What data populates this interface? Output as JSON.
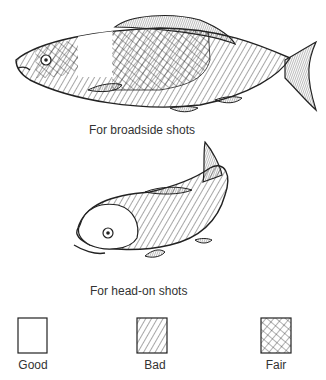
{
  "captions": {
    "broadside": "For broadside shots",
    "head_on": "For head-on shots"
  },
  "legend": [
    {
      "label": "Good",
      "pattern": "blank"
    },
    {
      "label": "Bad",
      "pattern": "diagonal-hatch"
    },
    {
      "label": "Fair",
      "pattern": "cross-hatch"
    }
  ],
  "colors": {
    "ink": "#222222",
    "background": "#ffffff"
  }
}
